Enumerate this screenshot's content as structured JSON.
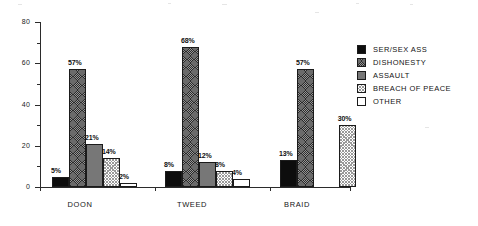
{
  "chart_data": {
    "type": "bar",
    "title": "",
    "subtitle": "",
    "xlabel": "",
    "ylabel": "",
    "ylim": [
      0,
      80
    ],
    "ytick_labels": [
      "0",
      "20",
      "40",
      "60",
      "80"
    ],
    "ytick_values": [
      0,
      20,
      40,
      60,
      80
    ],
    "yminor_values": [
      10,
      30,
      50,
      70
    ],
    "grid": false,
    "legend_position": "right",
    "categories": [
      "DOON",
      "TWEED",
      "BRAID"
    ],
    "series": [
      {
        "name": "SER/SEX ASS",
        "key": "serious",
        "swatch": "solid-black",
        "values": [
          5,
          8,
          13
        ],
        "labels": [
          "5%",
          "8%",
          "13%"
        ]
      },
      {
        "name": "DISHONESTY",
        "key": "dishonesty",
        "swatch": "dark-crosshatch",
        "values": [
          57,
          68,
          57
        ],
        "labels": [
          "57%",
          "68%",
          "57%"
        ]
      },
      {
        "name": "ASSAULT",
        "key": "assault",
        "swatch": "mid-gray",
        "values": [
          21,
          12,
          null
        ],
        "labels": [
          "21%",
          "12%",
          ""
        ]
      },
      {
        "name": "BREACH OF PEACE",
        "key": "breach",
        "swatch": "light-crosshatch",
        "values": [
          14,
          8,
          30
        ],
        "labels": [
          "14%",
          "8%",
          "30%"
        ]
      },
      {
        "name": "OTHER",
        "key": "other",
        "swatch": "white",
        "values": [
          2,
          4,
          null
        ],
        "labels": [
          "2%",
          "4%",
          ""
        ]
      }
    ]
  },
  "axis": {
    "y_labels": [
      "80",
      "60",
      "40",
      "20",
      "0"
    ]
  },
  "categories": {
    "doon": "DOON",
    "tweed": "TWEED",
    "braid": "BRAID"
  },
  "legend": {
    "items": [
      {
        "label": "SER/SEX ASS"
      },
      {
        "label": "DISHONESTY"
      },
      {
        "label": "ASSAULT"
      },
      {
        "label": "BREACH OF PEACE"
      },
      {
        "label": "OTHER"
      }
    ]
  },
  "bars": {
    "doon": [
      {
        "label": "5%",
        "value": 5
      },
      {
        "label": "57%",
        "value": 57
      },
      {
        "label": "21%",
        "value": 21
      },
      {
        "label": "14%",
        "value": 14
      },
      {
        "label": "2%",
        "value": 2
      }
    ],
    "tweed": [
      {
        "label": "8%",
        "value": 8
      },
      {
        "label": "68%",
        "value": 68
      },
      {
        "label": "12%",
        "value": 12
      },
      {
        "label": "8%",
        "value": 8
      },
      {
        "label": "4%",
        "value": 4
      }
    ],
    "braid": [
      {
        "label": "13%",
        "value": 13
      },
      {
        "label": "57%",
        "value": 57
      },
      {
        "label": "30%",
        "value": 30
      }
    ]
  },
  "colors": {
    "axis": "#2b2b2b",
    "text": "#141414",
    "serious": "#0d0d0d",
    "dishonesty": "#2a2a2a",
    "assault": "#777777",
    "breach": "#9a9a9a",
    "other": "#ffffff",
    "background": "#ffffff"
  }
}
